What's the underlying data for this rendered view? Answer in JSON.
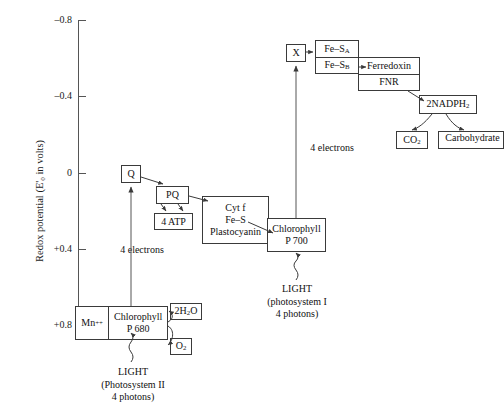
{
  "figure": {
    "type": "diagram"
  },
  "axis": {
    "title": "Redox potential (E'",
    "title_sub": "0",
    "title_tail": " in volts)",
    "ticks": [
      {
        "label": "–0.8",
        "value": -0.8
      },
      {
        "label": "–0.4",
        "value": -0.4
      },
      {
        "label": "0",
        "value": 0
      },
      {
        "label": "+0.4",
        "value": 0.4
      },
      {
        "label": "+0.8",
        "value": 0.8
      }
    ]
  },
  "boxes": {
    "mn": {
      "text": "Mn",
      "sup": "++"
    },
    "p680_l1": "Chlorophyll",
    "p680_l2": "P 680",
    "water": {
      "pre": "2H",
      "sub": "2",
      "post": "O"
    },
    "oxygen": {
      "pre": "O",
      "sub": "2"
    },
    "q": "Q",
    "pq": "PQ",
    "atp": "4 ATP",
    "cytf_l1": "Cyt f",
    "cytf_l2": "Fe–S",
    "cytf_l3": "Plastocyanin",
    "p700_l1": "Chlorophyll",
    "p700_l2": "P 700",
    "x": "X",
    "fesa": {
      "pre": "Fe–S",
      "sub": "A"
    },
    "fesb": {
      "pre": "Fe–S",
      "sub": "B"
    },
    "ferredoxin": "Ferredoxin",
    "fnr": "FNR",
    "nadph": {
      "pre": "2NADPH",
      "sub": "2"
    },
    "co2": {
      "pre": "CO",
      "sub": "2"
    },
    "carbohydrate": "Carbohydrate"
  },
  "labels": {
    "electrons_ps2": "4 electrons",
    "electrons_ps1": "4 electrons",
    "light_ps2_l1": "LIGHT",
    "light_ps2_l2": "(Photosystem II",
    "light_ps2_l3": "4 photons)",
    "light_ps1_l1": "LIGHT",
    "light_ps1_l2": "(photosystem I",
    "light_ps1_l3": "4 photons)"
  },
  "colors": {
    "stroke": "#3a3a3a",
    "axis": "#555555",
    "text": "#111111",
    "background": "#ffffff"
  }
}
